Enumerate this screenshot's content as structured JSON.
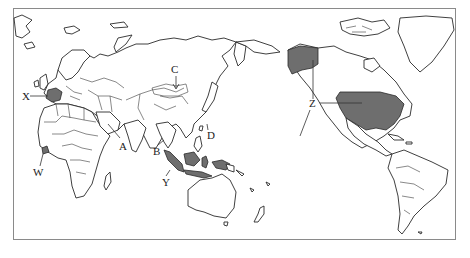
{
  "map": {
    "projection": "world map centered on the Pacific (Eurasia/Africa left, Americas right)",
    "colors": {
      "land": "#ffffff",
      "outline": "#2a2a2a",
      "highlight": "#6e6e6e",
      "frame": "#8a8a8a"
    },
    "labels": [
      {
        "id": "A",
        "text": "A",
        "target": "Red Sea / Arabian Peninsula area"
      },
      {
        "id": "B",
        "text": "B",
        "target": "Malay Peninsula"
      },
      {
        "id": "C",
        "text": "C",
        "target": "Mongolia"
      },
      {
        "id": "D",
        "text": "D",
        "target": "Taiwan / southern Japan area"
      },
      {
        "id": "W",
        "text": "W",
        "target": "West Africa (Ghana area)"
      },
      {
        "id": "X",
        "text": "X",
        "target": "France"
      },
      {
        "id": "Y",
        "text": "Y",
        "target": "Indonesia (Sumatra)"
      },
      {
        "id": "Z",
        "text": "Z",
        "target": "United States (incl. Alaska and Hawaii)"
      }
    ],
    "highlighted_regions": [
      "France",
      "Ghana",
      "Indonesia",
      "Alaska",
      "Contiguous United States"
    ]
  }
}
